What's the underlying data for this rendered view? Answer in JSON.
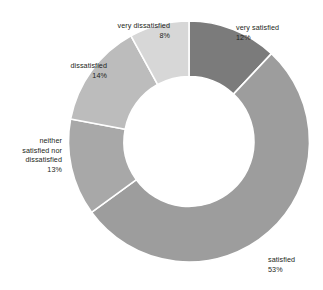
{
  "chart_data": {
    "type": "pie",
    "variant": "donut",
    "title": "",
    "subtitle": "",
    "xlabel": "",
    "ylabel": "",
    "legend_position": "none",
    "grid": false,
    "labels_show_percent": true,
    "start_angle_deg": 0,
    "direction": "clockwise",
    "categories": [
      "very satisfied",
      "satisfied",
      "neither satisfied nor dissatisfied",
      "dissatisfied",
      "very dissatisfied"
    ],
    "values": [
      12,
      53,
      13,
      14,
      8
    ],
    "value_labels": [
      "12%",
      "53%",
      "13%",
      "14%",
      "8%"
    ],
    "colors": [
      "#7b7b7b",
      "#9d9d9d",
      "#a8a8a8",
      "#bcbcbc",
      "#d7d7d7"
    ],
    "separator_color": "#ffffff",
    "background": "#ffffff",
    "slices": [
      {
        "label": "very satisfied",
        "value": 12,
        "value_label": "12%",
        "color": "#7b7b7b"
      },
      {
        "label": "satisfied",
        "value": 53,
        "value_label": "53%",
        "color": "#9d9d9d"
      },
      {
        "label": "neither satisfied nor dissatisfied",
        "value": 13,
        "value_label": "13%",
        "color": "#a8a8a8"
      },
      {
        "label": "dissatisfied",
        "value": 14,
        "value_label": "14%",
        "color": "#bcbcbc"
      },
      {
        "label": "very dissatisfied",
        "value": 8,
        "value_label": "8%",
        "color": "#d7d7d7"
      }
    ]
  },
  "callouts": {
    "very_satisfied": {
      "label": "very satisfied",
      "percent": "12%"
    },
    "satisfied": {
      "label": "satisfied",
      "percent": "53%"
    },
    "neither": {
      "label": "neither\nsatisfied nor\ndissatisfied",
      "percent": "13%"
    },
    "dissatisfied": {
      "label": "dissatisfied",
      "percent": "14%"
    },
    "very_dissatisfied": {
      "label": "very dissatisfied",
      "percent": "8%"
    }
  }
}
